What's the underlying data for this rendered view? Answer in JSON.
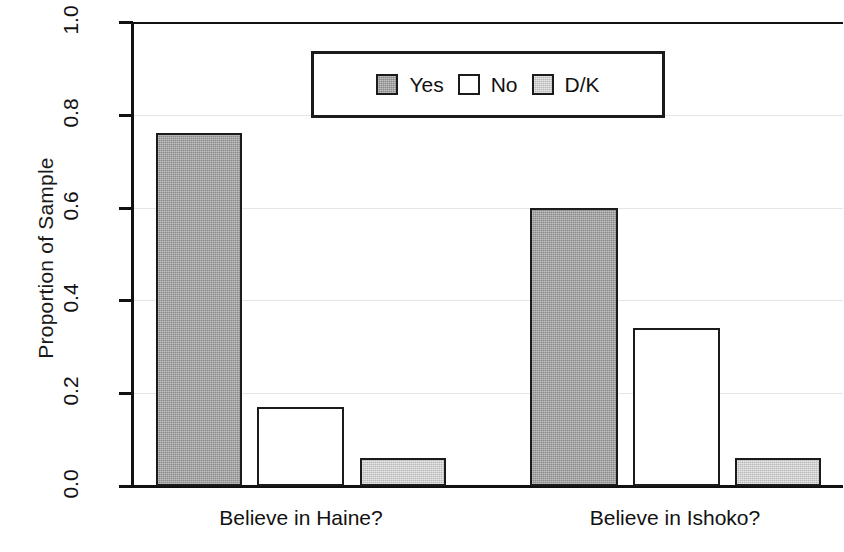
{
  "chart_data": {
    "type": "bar",
    "title": "",
    "xlabel": "",
    "ylabel": "Proportion of Sample",
    "ylim": [
      0.0,
      1.0
    ],
    "grid": true,
    "legend_position": "top-center",
    "categories": [
      "Believe in Haine?",
      "Believe in Ishoko?"
    ],
    "series": [
      {
        "name": "Yes",
        "values": [
          0.76,
          0.6
        ],
        "color": "#a9a9a9"
      },
      {
        "name": "No",
        "values": [
          0.17,
          0.34
        ],
        "color": "#ffffff"
      },
      {
        "name": "D/K",
        "values": [
          0.06,
          0.06
        ],
        "color": "#d3d3d3"
      }
    ],
    "ytick_labels": [
      "0.0",
      "0.2",
      "0.4",
      "0.6",
      "0.8",
      "1.0"
    ],
    "ytick_values": [
      0.0,
      0.2,
      0.4,
      0.6,
      0.8,
      1.0
    ]
  },
  "axes": {
    "y_label": "Proportion of Sample",
    "y_ticks": [
      {
        "label": "1.0",
        "value": 1.0
      },
      {
        "label": "0.8",
        "value": 0.8
      },
      {
        "label": "0.6",
        "value": 0.6
      },
      {
        "label": "0.4",
        "value": 0.4
      },
      {
        "label": "0.2",
        "value": 0.2
      },
      {
        "label": "0.0",
        "value": 0.0
      }
    ],
    "x_groups": [
      {
        "label": "Believe in Haine?"
      },
      {
        "label": "Believe in Ishoko?"
      }
    ]
  },
  "legend": {
    "items": [
      {
        "label": "Yes",
        "swatch": "#a9a9a9"
      },
      {
        "label": "No",
        "swatch": "#ffffff"
      },
      {
        "label": "D/K",
        "swatch": "#d3d3d3"
      }
    ]
  },
  "bars": [
    {
      "group": "Believe in Haine?",
      "series": "Yes",
      "value": 0.76,
      "left": 156,
      "width": 86,
      "fill": "fill-yes"
    },
    {
      "group": "Believe in Haine?",
      "series": "No",
      "value": 0.17,
      "left": 257,
      "width": 87,
      "fill": "fill-no"
    },
    {
      "group": "Believe in Haine?",
      "series": "D/K",
      "value": 0.06,
      "left": 360,
      "width": 86,
      "fill": "fill-dk"
    },
    {
      "group": "Believe in Ishoko?",
      "series": "Yes",
      "value": 0.6,
      "left": 530,
      "width": 88,
      "fill": "fill-yes"
    },
    {
      "group": "Believe in Ishoko?",
      "series": "No",
      "value": 0.34,
      "left": 633,
      "width": 87,
      "fill": "fill-no"
    },
    {
      "group": "Believe in Ishoko?",
      "series": "D/K",
      "value": 0.06,
      "left": 735,
      "width": 86,
      "fill": "fill-dk"
    }
  ],
  "geometry": {
    "baseline_y": 486,
    "top_y": 22,
    "plot_height": 464,
    "group_label_x": [
      155,
      529
    ],
    "group_label_w": [
      292,
      292
    ]
  }
}
